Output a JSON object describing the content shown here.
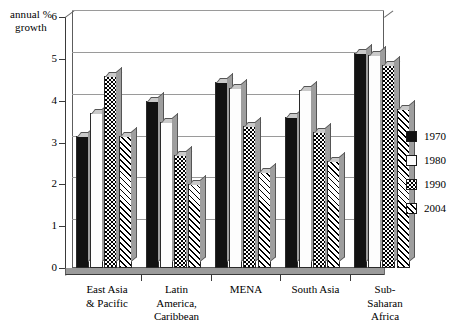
{
  "chart_data": {
    "type": "bar",
    "title": "",
    "xlabel": "",
    "ylabel": "annual % growth",
    "ylim": [
      0,
      6
    ],
    "yticks": [
      0,
      1,
      2,
      3,
      4,
      5,
      6
    ],
    "grid": true,
    "legend_position": "right",
    "categories": [
      "East Asia & Pacific",
      "Latin America, Caribbean",
      "MENA",
      "South Asia",
      "Sub-Saharan Africa"
    ],
    "category_lines": [
      [
        "East Asia",
        "& Pacific"
      ],
      [
        "Latin",
        "America,",
        "Caribbean"
      ],
      [
        "MENA"
      ],
      [
        "South Asia"
      ],
      [
        "Sub-",
        "Saharan",
        "Africa"
      ]
    ],
    "series": [
      {
        "name": "1970",
        "values": [
          3.15,
          4.0,
          4.45,
          3.6,
          5.15
        ]
      },
      {
        "name": "1980",
        "values": [
          3.7,
          3.5,
          4.3,
          4.25,
          5.1
        ]
      },
      {
        "name": "1990",
        "values": [
          4.6,
          2.7,
          3.4,
          3.25,
          4.85
        ]
      },
      {
        "name": "2004",
        "values": [
          3.15,
          2.0,
          2.3,
          2.55,
          3.8
        ]
      }
    ]
  },
  "axis": {
    "y_title_line1": "annual %",
    "y_title_line2": "growth",
    "y_tick_labels": [
      "0",
      "1",
      "2",
      "3",
      "4",
      "5",
      "6"
    ]
  },
  "legend": {
    "items": [
      {
        "label": "1970",
        "pattern": "solid-black",
        "color": "#121212"
      },
      {
        "label": "1980",
        "pattern": "solid-white",
        "color": "#ffffff"
      },
      {
        "label": "1990",
        "pattern": "checkerboard",
        "color": "#000000"
      },
      {
        "label": "2004",
        "pattern": "diagonal-hatch",
        "color": "#000000"
      }
    ]
  }
}
